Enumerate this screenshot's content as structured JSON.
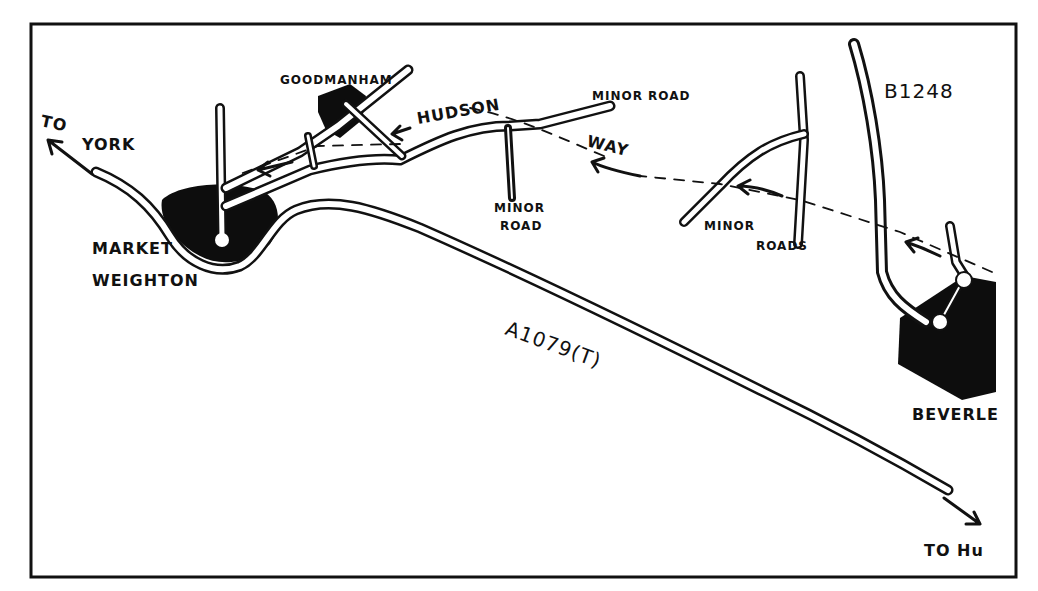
{
  "map": {
    "title": "Hudson Way route map",
    "colors": {
      "ink": "#111111",
      "paper": "#ffffff"
    },
    "labels": {
      "to_york_1": "TO",
      "to_york_2": "YORK",
      "goodmanham": "GOODMANHAM",
      "hudson": "HUDSON",
      "way": "WAY",
      "minor_road_ne": "MINOR ROAD",
      "minor_road_s_1": "MINOR",
      "minor_road_s_2": "ROAD",
      "minor_roads_1": "MINOR",
      "minor_roads_2": "ROADS",
      "b1248": "B1248",
      "market_1": "MARKET",
      "market_2": "WEIGHTON",
      "a1079": "A1079(T)",
      "beverley": "BEVERLE",
      "to_hull": "TO Hu"
    },
    "towns": [
      "Market Weighton",
      "Goodmanham",
      "Beverley"
    ],
    "roads": [
      "A1079(T)",
      "B1248",
      "Minor Road",
      "Minor Roads"
    ],
    "trail": {
      "name": "Hudson Way",
      "direction": "westbound arrows towards Market Weighton"
    }
  }
}
